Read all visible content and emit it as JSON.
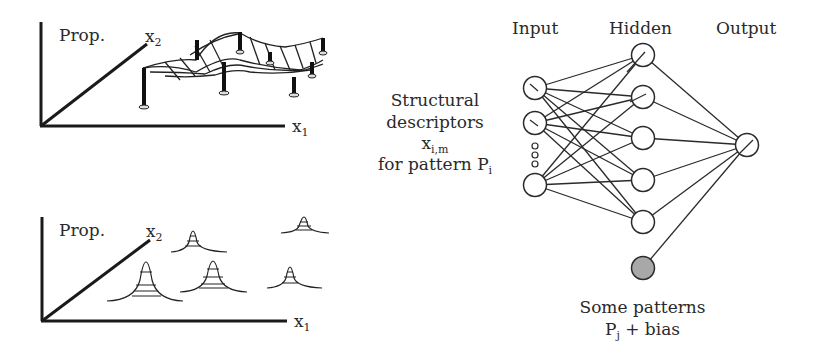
{
  "top_plot": {
    "y_label": "Prop.",
    "x2_label": "x",
    "x2_sub": "2",
    "x1_label": "x",
    "x1_sub": "1",
    "description": "mesh surface supported by pillars"
  },
  "bottom_plot": {
    "y_label": "Prop.",
    "x2_label": "x",
    "x2_sub": "2",
    "x1_label": "x",
    "x1_sub": "1",
    "description": "gaussian peaks at data points"
  },
  "network": {
    "layer_labels": [
      "Input",
      "Hidden",
      "Output"
    ],
    "input_caption": {
      "line1": "Structural",
      "line2": "descriptors",
      "var": "x",
      "var_sub": "i,m",
      "line4": "for pattern P",
      "line4_sub": "i"
    },
    "bias_caption": {
      "line1": "Some patterns",
      "line2_pre": "P",
      "line2_sub": "j",
      "line2_post": " + bias"
    },
    "colors": {
      "stroke": "#2a2a2a",
      "bias_fill": "#a8a8a8"
    }
  }
}
